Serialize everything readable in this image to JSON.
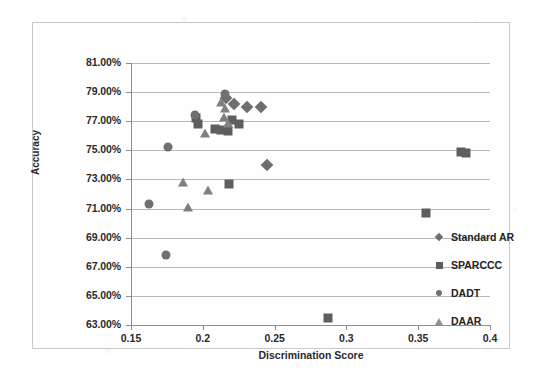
{
  "chart_data": {
    "type": "scatter",
    "title": "",
    "xlabel": "Discrimination Score",
    "ylabel": "Accuracy",
    "xlim": [
      0.15,
      0.4
    ],
    "ylim": [
      63.0,
      81.0
    ],
    "xticks": [
      "0.15",
      "0.2",
      "0.25",
      "0.3",
      "0.35",
      "0.4"
    ],
    "xtick_values": [
      0.15,
      0.2,
      0.25,
      0.3,
      0.35,
      0.4
    ],
    "yticks": [
      "63.00%",
      "65.00%",
      "67.00%",
      "69.00%",
      "71.00%",
      "73.00%",
      "75.00%",
      "77.00%",
      "79.00%",
      "81.00%"
    ],
    "ytick_values": [
      63,
      65,
      67,
      69,
      71,
      73,
      75,
      77,
      79,
      81
    ],
    "grid": "horizontal",
    "legend_position": "right",
    "series": [
      {
        "name": "Standard AR",
        "marker": "diamond",
        "color": "#6e6e6e",
        "points": [
          [
            0.216,
            78.6
          ],
          [
            0.222,
            78.2
          ],
          [
            0.2305,
            78.0
          ],
          [
            0.2405,
            78.0
          ],
          [
            0.245,
            74.0
          ]
        ]
      },
      {
        "name": "SPARCCC",
        "marker": "square",
        "color": "#5e5e5e",
        "points": [
          [
            0.1955,
            77.2
          ],
          [
            0.197,
            76.8
          ],
          [
            0.2085,
            76.5
          ],
          [
            0.2125,
            76.4
          ],
          [
            0.2175,
            76.3
          ],
          [
            0.2205,
            77.1
          ],
          [
            0.2255,
            76.8
          ],
          [
            0.218,
            72.7
          ],
          [
            0.3555,
            70.7
          ],
          [
            0.3795,
            74.9
          ],
          [
            0.3835,
            74.85
          ],
          [
            0.2875,
            63.5
          ]
        ]
      },
      {
        "name": "DADT",
        "marker": "circle",
        "color": "#707070",
        "points": [
          [
            0.1945,
            77.4
          ],
          [
            0.2155,
            78.9
          ],
          [
            0.1755,
            75.2
          ],
          [
            0.1625,
            71.3
          ],
          [
            0.1745,
            67.8
          ]
        ]
      },
      {
        "name": "DAAR",
        "marker": "triangle",
        "color": "#808080",
        "points": [
          [
            0.2125,
            78.3
          ],
          [
            0.2155,
            77.9
          ],
          [
            0.2145,
            77.3
          ],
          [
            0.2175,
            76.9
          ],
          [
            0.2015,
            76.2
          ],
          [
            0.1865,
            72.8
          ],
          [
            0.2035,
            72.3
          ],
          [
            0.1895,
            71.1
          ]
        ]
      }
    ]
  },
  "legend": {
    "items": [
      {
        "label": "Standard AR",
        "marker": "diamond"
      },
      {
        "label": "SPARCCC",
        "marker": "square"
      },
      {
        "label": "DADT",
        "marker": "circle"
      },
      {
        "label": "DAAR",
        "marker": "triangle"
      }
    ]
  }
}
